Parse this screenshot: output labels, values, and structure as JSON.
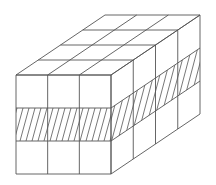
{
  "figure": {
    "cubes_wide": 3,
    "cubes_high": 3,
    "cubes_deep": 4,
    "hatched_layer": "middle",
    "colors": {
      "line": "#555555",
      "background": "#ffffff"
    }
  },
  "geometry": {
    "front_origin": [
      16,
      75
    ],
    "unit_w": 31.67,
    "unit_h": 33,
    "depth_step": [
      22.25,
      -15
    ],
    "hatch_spacing": 6
  }
}
